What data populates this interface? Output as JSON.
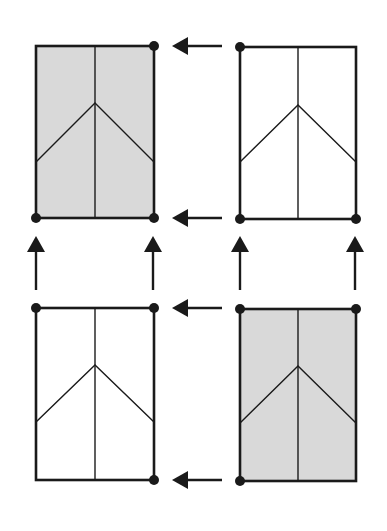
{
  "diagram": {
    "title": "",
    "colors": {
      "stroke": "#1a1a1a",
      "shaded_fill": "#d9d9d9",
      "plain_fill": "#ffffff",
      "background": "#ffffff"
    },
    "panels": [
      {
        "id": "top-left",
        "shaded": true,
        "x": 36,
        "y": 46,
        "w": 118,
        "h": 172,
        "apex_dy": 57,
        "side_dy": 116,
        "dots": [
          "top-right",
          "bottom-left",
          "bottom-right"
        ]
      },
      {
        "id": "top-right",
        "shaded": false,
        "x": 240,
        "y": 47,
        "w": 116,
        "h": 172,
        "apex_dy": 58,
        "side_dy": 115,
        "dots": [
          "top-left",
          "bottom-left",
          "bottom-right"
        ]
      },
      {
        "id": "bottom-left",
        "shaded": false,
        "x": 36,
        "y": 308,
        "w": 118,
        "h": 172,
        "apex_dy": 57,
        "side_dy": 114,
        "dots": [
          "top-left",
          "top-right",
          "bottom-right"
        ]
      },
      {
        "id": "bottom-right",
        "shaded": true,
        "x": 240,
        "y": 309,
        "w": 116,
        "h": 172,
        "apex_dy": 57,
        "side_dy": 114,
        "dots": [
          "top-left",
          "top-right",
          "bottom-left"
        ]
      }
    ],
    "arrows": [
      {
        "id": "arrow-top-upper-left",
        "direction": "left",
        "x1": 222,
        "y1": 46,
        "x2": 172,
        "y2": 46
      },
      {
        "id": "arrow-top-lower-left",
        "direction": "left",
        "x1": 222,
        "y1": 218,
        "x2": 172,
        "y2": 218
      },
      {
        "id": "arrow-bottom-upper-left",
        "direction": "left",
        "x1": 222,
        "y1": 308,
        "x2": 172,
        "y2": 308
      },
      {
        "id": "arrow-bottom-lower-left",
        "direction": "left",
        "x1": 222,
        "y1": 480,
        "x2": 172,
        "y2": 480
      },
      {
        "id": "arrow-up-1",
        "direction": "up",
        "x1": 36,
        "y1": 290,
        "x2": 36,
        "y2": 236
      },
      {
        "id": "arrow-up-2",
        "direction": "up",
        "x1": 153,
        "y1": 290,
        "x2": 153,
        "y2": 236
      },
      {
        "id": "arrow-up-3",
        "direction": "up",
        "x1": 240,
        "y1": 290,
        "x2": 240,
        "y2": 236
      },
      {
        "id": "arrow-up-4",
        "direction": "up",
        "x1": 355,
        "y1": 290,
        "x2": 355,
        "y2": 236
      }
    ]
  }
}
